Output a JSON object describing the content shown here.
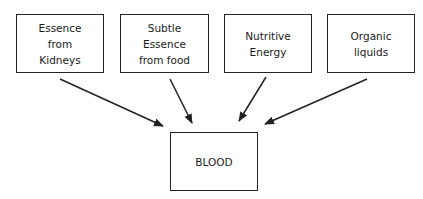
{
  "diagram": {
    "sources": [
      {
        "id": "kidneys",
        "label": "Essence\nfrom\nKidneys"
      },
      {
        "id": "food",
        "label": "Subtle\nEssence\nfrom food"
      },
      {
        "id": "nutritive",
        "label": "Nutritive\nEnergy"
      },
      {
        "id": "liquids",
        "label": "Organic\nliquids"
      }
    ],
    "target": {
      "id": "blood",
      "label": "BLOOD"
    },
    "edges": [
      {
        "from": "kidneys",
        "to": "blood"
      },
      {
        "from": "food",
        "to": "blood"
      },
      {
        "from": "nutritive",
        "to": "blood"
      },
      {
        "from": "liquids",
        "to": "blood"
      }
    ]
  }
}
